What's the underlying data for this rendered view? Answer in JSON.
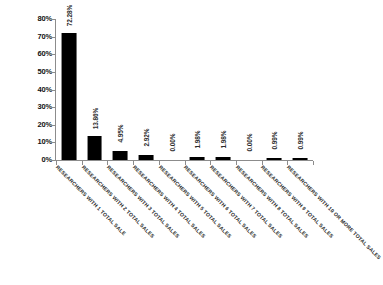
{
  "chart_data": {
    "type": "bar",
    "title": "",
    "subtitle": "",
    "xlabel": "",
    "ylabel": "",
    "ylim": [
      0,
      80
    ],
    "ytick_labels": [
      "80%",
      "70%",
      "60%",
      "50%",
      "40%",
      "30%",
      "20%",
      "10%",
      "0%"
    ],
    "ytick_values": [
      80,
      70,
      60,
      50,
      40,
      30,
      20,
      10,
      0
    ],
    "grid": false,
    "legend": false,
    "bar_color": "#000000",
    "axis_color": "#8c8c8c",
    "background_color": "#ffffff",
    "categories": [
      "RESEARCHERS WITH 1 TOTAL SALE",
      "RESEARCHERS WITH 2 TOTAL SALES",
      "RESEARCHERS WITH 3 TOTAL SALES",
      "RESEARCHERS WITH 4 TOTAL SALES",
      "RESEARCHERS WITH 5 TOTAL SALES",
      "RESEARCHERS WITH 6 TOTAL SALES",
      "RESEARCHERS WITH 7 TOTAL SALES",
      "RESEARCHERS WITH 8 TOTAL SALES",
      "RESEARCHERS WITH 9 TOTAL SALES",
      "RESEARCHERS WITH 10 OR MORE TOTAL SALES"
    ],
    "values": [
      72.28,
      13.86,
      4.95,
      2.92,
      0.0,
      1.98,
      1.98,
      0.0,
      0.99,
      0.99
    ],
    "value_labels": [
      "72.28%",
      "13.86%",
      "4.95%",
      "2.92%",
      "0.00%",
      "1.98%",
      "1.98%",
      "0.00%",
      "0.99%",
      "0.99%"
    ]
  }
}
